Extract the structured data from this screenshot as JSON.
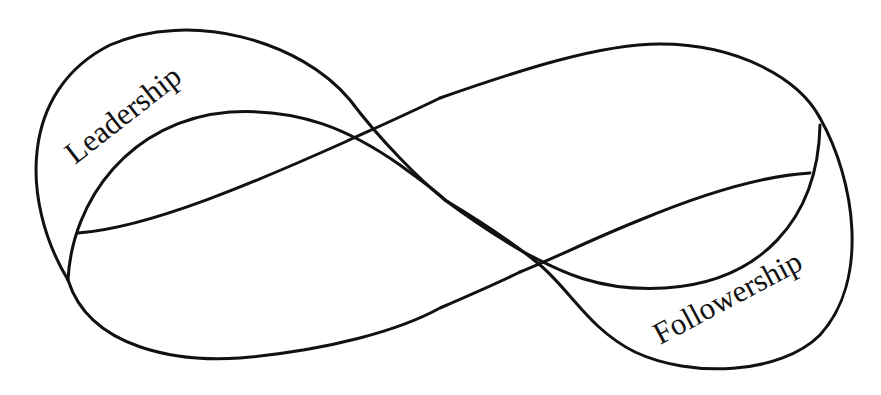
{
  "diagram": {
    "type": "mobius-strip",
    "labels": {
      "left": "Leadership",
      "right": "Followership"
    },
    "colors": {
      "stroke": "#111111",
      "background": "#ffffff"
    }
  }
}
